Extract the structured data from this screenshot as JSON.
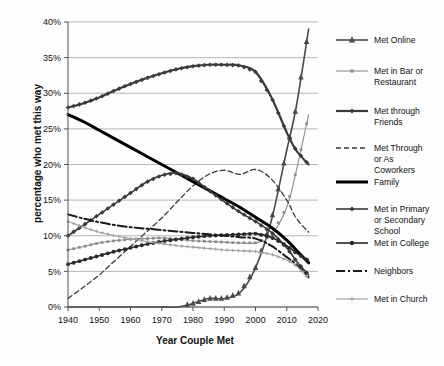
{
  "chart_data": {
    "type": "line",
    "title": "",
    "xlabel": "Year Couple Met",
    "ylabel": "percentage who met this way",
    "xlim": [
      1940,
      2020
    ],
    "ylim": [
      0,
      40
    ],
    "xticks": [
      "1940",
      "1950",
      "1960",
      "1970",
      "1980",
      "1990",
      "2000",
      "2010",
      "2020"
    ],
    "yticks": [
      "0%",
      "5%",
      "10%",
      "15%",
      "20%",
      "25%",
      "30%",
      "35%",
      "40%"
    ],
    "grid": true,
    "legend_position": "right",
    "x": [
      1940,
      1945,
      1950,
      1955,
      1960,
      1965,
      1970,
      1975,
      1980,
      1985,
      1990,
      1995,
      2000,
      2005,
      2010,
      2013,
      2017
    ],
    "series": [
      {
        "name": "Met Online",
        "color": "#4a4a4a",
        "marker": "triangle",
        "dash": "none",
        "width": 1.6,
        "values": [
          0,
          0,
          0,
          0,
          0,
          0,
          0,
          0,
          0.5,
          1.2,
          1.2,
          2.0,
          5.5,
          12.0,
          22.0,
          28.0,
          39.0
        ]
      },
      {
        "name": "Met in Bar or Restaurant",
        "color": "#8d8d8d",
        "marker": "square",
        "dash": "none",
        "width": 1.1,
        "values": [
          8.0,
          8.5,
          9.0,
          9.3,
          9.5,
          9.6,
          9.7,
          9.5,
          9.3,
          9.2,
          9.1,
          9.0,
          9.0,
          10.0,
          14.0,
          19.0,
          27.0
        ]
      },
      {
        "name": "Met through Friends",
        "color": "#3a3a3a",
        "marker": "diamond",
        "dash": "none",
        "width": 2.2,
        "values": [
          28.0,
          28.6,
          29.4,
          30.4,
          31.3,
          32.1,
          32.8,
          33.4,
          33.8,
          34.0,
          34.0,
          33.9,
          33.0,
          29.5,
          24.5,
          22.0,
          20.0
        ]
      },
      {
        "name": "Met Through or As Coworkers",
        "color": "#3a3a3a",
        "marker": "none",
        "dash": "5,3",
        "width": 1.3,
        "values": [
          1.2,
          2.8,
          4.5,
          6.5,
          8.5,
          10.5,
          12.5,
          14.8,
          17.0,
          18.6,
          19.2,
          18.6,
          19.3,
          18.0,
          15.0,
          12.5,
          10.5
        ]
      },
      {
        "name": "Family",
        "color": "#000000",
        "marker": "none",
        "dash": "none",
        "width": 3.0,
        "values": [
          27.0,
          26.0,
          24.8,
          23.6,
          22.4,
          21.2,
          20.0,
          18.8,
          17.6,
          16.4,
          15.2,
          14.0,
          12.6,
          11.2,
          9.4,
          8.0,
          6.2
        ]
      },
      {
        "name": "Met in Primary or Secondary School",
        "color": "#3a3a3a",
        "marker": "diamond",
        "dash": "none",
        "width": 1.6,
        "values": [
          10.0,
          11.5,
          13.0,
          14.5,
          16.0,
          17.5,
          18.5,
          18.8,
          18.0,
          16.4,
          14.8,
          13.3,
          12.0,
          10.5,
          8.3,
          6.5,
          4.5
        ]
      },
      {
        "name": "Met in College",
        "color": "#2a2a2a",
        "marker": "circle",
        "dash": "none",
        "width": 1.6,
        "values": [
          6.0,
          6.6,
          7.2,
          7.8,
          8.3,
          8.8,
          9.2,
          9.5,
          9.8,
          10.0,
          10.1,
          10.2,
          10.3,
          9.8,
          8.6,
          7.6,
          6.5
        ]
      },
      {
        "name": "Neighbors",
        "color": "#1a1a1a",
        "marker": "none",
        "dash": "9,3,2,3",
        "width": 2.0,
        "values": [
          13.0,
          12.4,
          11.9,
          11.5,
          11.2,
          11.0,
          10.8,
          10.6,
          10.4,
          10.2,
          10.0,
          9.8,
          9.6,
          8.6,
          7.0,
          6.0,
          4.2
        ]
      },
      {
        "name": "Met in Church",
        "color": "#9d9d9d",
        "marker": "plus",
        "dash": "none",
        "width": 1.1,
        "values": [
          12.0,
          11.2,
          10.5,
          10.0,
          9.6,
          9.2,
          8.9,
          8.6,
          8.4,
          8.2,
          8.0,
          7.9,
          7.8,
          7.4,
          6.6,
          5.8,
          4.0
        ]
      }
    ]
  },
  "legend": {
    "items": [
      {
        "label": "Met Online"
      },
      {
        "label": "Met in Bar or"
      },
      {
        "label": "Restaurant"
      },
      {
        "label": "Met through"
      },
      {
        "label": "Friends"
      },
      {
        "label": "Met Through"
      },
      {
        "label": "or As"
      },
      {
        "label": "Coworkers"
      },
      {
        "label": "Family"
      },
      {
        "label": "Met in Primary"
      },
      {
        "label": "or Secondary"
      },
      {
        "label": "School"
      },
      {
        "label": "Met in College"
      },
      {
        "label": "Neighbors"
      },
      {
        "label": "Met in Church"
      }
    ]
  }
}
